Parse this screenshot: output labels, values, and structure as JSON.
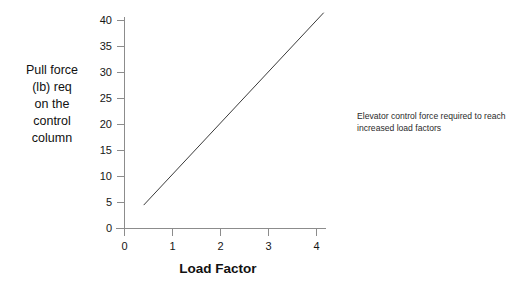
{
  "chart_data": {
    "type": "line",
    "title": "",
    "subtitle": "",
    "xlabel": "Load Factor",
    "ylabel": "Pull force (lb) req on the control column",
    "ylabel_lines": [
      "Pull force",
      "(lb) req",
      "on the",
      "control",
      "column"
    ],
    "annotation": "Elevator control force required to reach increased load factors",
    "annotation_lines": [
      "Elevator control force required to reach",
      "increased load factors"
    ],
    "xlim": [
      0,
      4.3
    ],
    "ylim": [
      0,
      43
    ],
    "xticks": [
      0,
      1,
      2,
      3,
      4
    ],
    "xtick_labels": [
      "0",
      "1",
      "2",
      "3",
      "4"
    ],
    "yticks": [
      0,
      5,
      10,
      15,
      20,
      25,
      30,
      35,
      40
    ],
    "ytick_labels": [
      "0",
      "5",
      "10",
      "15",
      "20",
      "25",
      "30",
      "35",
      "40"
    ],
    "grid": false,
    "legend": false,
    "series": [
      {
        "name": "Pull force vs load factor",
        "color": "#3a3a3a",
        "x": [
          0.4,
          4.15
        ],
        "values": [
          4.5,
          41.5
        ],
        "slope": 9.87,
        "intercept": 0.55
      }
    ],
    "background_color": "#ffffff",
    "axis_color": "#8c8c8c",
    "text_color": "#161616"
  }
}
